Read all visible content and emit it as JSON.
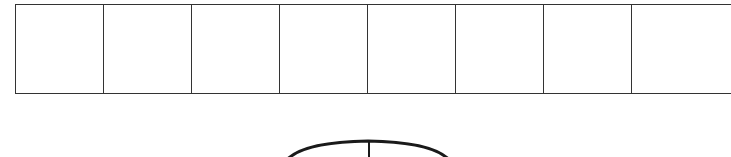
{
  "diagram": {
    "type": "cell-strip-with-arc",
    "grid": {
      "rows": 1,
      "visible_columns": 8,
      "last_column_clipped": true,
      "cells": [
        "",
        "",
        "",
        "",
        "",
        "",
        "",
        ""
      ]
    },
    "arc": {
      "shape": "semicircle-top",
      "has_center_tick": true
    },
    "colors": {
      "line": "#333333",
      "arc": "#1a1a1a",
      "background": "#ffffff"
    }
  }
}
